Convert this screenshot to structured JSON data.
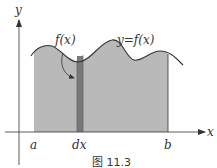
{
  "figure": {
    "caption": "图 11.3",
    "labels": {
      "y_axis": "y",
      "x_axis": "x",
      "function_label": "f(x)",
      "curve_label": "y=f(x)",
      "lower_bound": "a",
      "upper_bound": "b",
      "differential": "dx"
    },
    "colors": {
      "region_fill": "#b9b9b9",
      "strip_fill": "#7a7a7a",
      "stroke": "#333333",
      "background": "#ffffff"
    }
  }
}
